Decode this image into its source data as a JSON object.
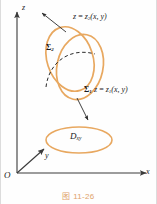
{
  "figure": {
    "caption": "图 11-26",
    "caption_color": "#e0a36a",
    "curve_color": "#e8a860",
    "axis_color": "#3a3a3a",
    "dash_color": "#2b2b2b"
  },
  "axes": {
    "z_label": "z",
    "y_label": "y",
    "x_label": "x",
    "origin_label": "O"
  },
  "surfaces": {
    "upper": {
      "name": "Σ",
      "sub": "2",
      "equation_lhs": "z",
      "equation_eq": " = ",
      "equation_fn": "z",
      "equation_fn_sub": "2",
      "equation_args": "(x, y)"
    },
    "lower": {
      "name": "Σ",
      "sub": "1",
      "equation_lhs": "z",
      "equation_eq": " = ",
      "equation_fn": "z",
      "equation_fn_sub": "1",
      "equation_args": "(x, y)"
    }
  },
  "domain_region": {
    "symbol": "D",
    "sub": "xy"
  }
}
